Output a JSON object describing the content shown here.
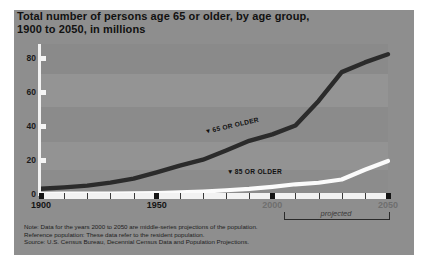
{
  "title": {
    "line1": "Total number of persons age 65 or older, by age group,",
    "line2": "1900 to 2050, in millions"
  },
  "axes": {
    "y_ticks": [
      "0",
      "20",
      "40",
      "60",
      "80"
    ],
    "x_major_labels": [
      "1900",
      "1950",
      "2000",
      "2050"
    ],
    "projected_label": "projected"
  },
  "annotations": {
    "series65": "65 OR OLDER",
    "series85": "85 OR OLDER",
    "marker_glyph": "▼"
  },
  "notes": {
    "line1": "Note: Data for the years 2000 to 2050 are middle-series projections of the population.",
    "line2": "Reference population: These data refer to the resident population.",
    "line3": "Source: U.S. Census Bureau, Decennial Census Data and Population Projections."
  },
  "colors": {
    "card_background": "#8e8e8e",
    "page_background": "#ffffff",
    "series65_line": "#2b2b2b",
    "series85_line": "#fbfbfb",
    "axis": "#f2f2f2",
    "tick_major": "#141414",
    "text": "#111111"
  },
  "chart_data": {
    "type": "line",
    "title": "Total number of persons age 65 or older, by age group, 1900 to 2050, in millions",
    "xlabel": "",
    "ylabel": "Millions",
    "xlim": [
      1900,
      2050
    ],
    "ylim": [
      0,
      88
    ],
    "yticks": [
      0,
      20,
      40,
      60,
      80
    ],
    "xticks": [
      1900,
      1910,
      1920,
      1930,
      1940,
      1950,
      1960,
      1970,
      1980,
      1990,
      2000,
      2010,
      2020,
      2030,
      2040,
      2050
    ],
    "grid": false,
    "legend": "inline-annotations",
    "projected_from": 2000,
    "x": [
      1900,
      1910,
      1920,
      1930,
      1940,
      1950,
      1960,
      1970,
      1980,
      1990,
      2000,
      2010,
      2020,
      2030,
      2040,
      2050
    ],
    "series": [
      {
        "name": "65 OR OLDER",
        "values": [
          3.1,
          3.9,
          4.9,
          6.7,
          9.0,
          12.7,
          16.7,
          20.1,
          25.5,
          31.2,
          35.0,
          40.2,
          54.6,
          71.5,
          77.2,
          82.0
        ]
      },
      {
        "name": "85 OR OLDER",
        "values": [
          0.1,
          0.2,
          0.2,
          0.3,
          0.4,
          0.6,
          0.9,
          1.4,
          2.2,
          3.0,
          4.2,
          5.7,
          6.6,
          8.5,
          14.2,
          19.4
        ]
      }
    ]
  }
}
